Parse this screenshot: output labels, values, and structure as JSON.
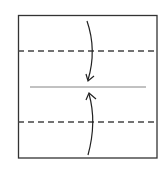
{
  "diagram": {
    "type": "origami-fold-instruction",
    "colors": {
      "paper_edge": "#333333",
      "dashed_fold": "#444444",
      "center_line": "#777777",
      "arrow": "#222222",
      "background": "#ffffff"
    },
    "paper": {
      "x": 18,
      "y": 15,
      "width": 139,
      "height": 143
    },
    "lines": [
      {
        "kind": "valley-fold-dashed",
        "y": 51
      },
      {
        "kind": "center-crease",
        "y": 87,
        "x1": 30,
        "x2": 146
      },
      {
        "kind": "valley-fold-dashed",
        "y": 122
      }
    ],
    "arrows": [
      {
        "direction": "down",
        "from": "top-edge",
        "to": "center-crease"
      },
      {
        "direction": "up",
        "from": "bottom-edge",
        "to": "center-crease"
      }
    ]
  }
}
